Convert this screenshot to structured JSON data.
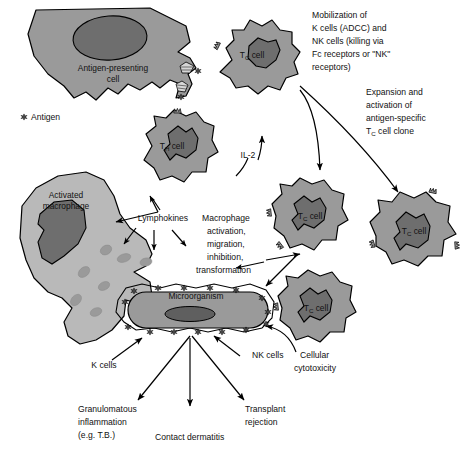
{
  "diagram": {
    "type": "immunology-schematic",
    "colors": {
      "cytoplasm": "#9a9a9a",
      "cytoplasm_light": "#b9b9b9",
      "nucleus": "#6e6e6e",
      "nucleus_dark": "#5f5f5f",
      "outline": "#000000",
      "background": "#ffffff",
      "text": "#111111"
    }
  },
  "legend": {
    "antigen_label": "Antigen",
    "antigen_icon": "antigen-starburst-icon"
  },
  "cells": {
    "apc": {
      "label_line1": "Antigen-presenting",
      "label_line2": "cell",
      "name": "antigen-presenting-cell"
    },
    "th": {
      "label_main": "T",
      "label_sub": "H",
      "label_tail": " cell",
      "name": "th-cell"
    },
    "tc_top": {
      "label_main": "T",
      "label_sub": "C",
      "label_tail": " cell",
      "name": "tc-cell-top"
    },
    "tc_mid": {
      "label_main": "T",
      "label_sub": "C",
      "label_tail": " cell",
      "name": "tc-cell-middle"
    },
    "tc_right": {
      "label_main": "T",
      "label_sub": "C",
      "label_tail": " cell",
      "name": "tc-cell-right"
    },
    "tc_lower": {
      "label_main": "T",
      "label_sub": "C",
      "label_tail": " cell",
      "name": "tc-cell-lower"
    },
    "macrophage": {
      "label_line1": "Activated",
      "label_line2": "macrophage",
      "name": "activated-macrophage"
    },
    "microorganism": {
      "label": "Microorganism",
      "name": "microorganism"
    }
  },
  "annotations": {
    "mobilization": [
      "Mobilization of",
      "K cells (ADCC) and",
      "NK cells (killing via",
      "Fc receptors or \"NK\"",
      "receptors)"
    ],
    "expansion": [
      "Expansion and",
      "activation of",
      "antigen-specific"
    ],
    "expansion_last_main": "T",
    "expansion_last_sub": "C",
    "expansion_last_tail": " cell clone",
    "il2": "IL-2",
    "lymphokines": "Lymphokines",
    "macrophage_effects": [
      "Macrophage",
      "activation,",
      "migration,",
      "inhibition,",
      "transformation"
    ],
    "k_cells": "K cells",
    "nk_cells": "NK cells",
    "cellular_cytotoxicity": [
      "Cellular",
      "cytotoxicity"
    ],
    "outcomes": {
      "granulomatous": [
        "Granulomatous",
        "inflammation",
        "(e.g. T.B.)"
      ],
      "contact_dermatitis": "Contact dermatitis",
      "transplant_rejection": [
        "Transplant",
        "rejection"
      ]
    }
  }
}
